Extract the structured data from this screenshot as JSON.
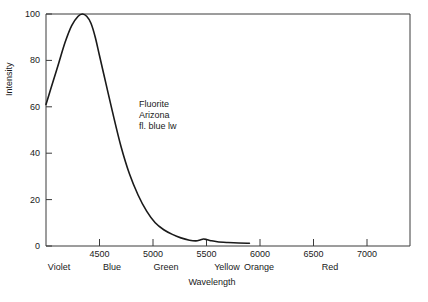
{
  "figure": {
    "background": "#ffffff",
    "line_color": "#1a1a1a",
    "axis_color": "#3a3a3a"
  },
  "annotation": {
    "line1": "Fluorite",
    "line2": "Arizona",
    "line3": "fl. blue lw"
  },
  "axis": {
    "xlabel": "Wavelength",
    "ylabel": "Intensity"
  },
  "bands": [
    {
      "label": "Violet",
      "wavelength": 4150
    },
    {
      "label": "Blue",
      "wavelength": 4650
    },
    {
      "label": "Green",
      "wavelength": 5150
    },
    {
      "label": "Yellow",
      "wavelength": 5720
    },
    {
      "label": "Orange",
      "wavelength": 6020
    },
    {
      "label": "Red",
      "wavelength": 6600
    }
  ],
  "chart_data": {
    "type": "line",
    "title": "",
    "subtitle": "",
    "xlabel": "Wavelength",
    "ylabel": "Intensity",
    "xlim": [
      4000,
      7400
    ],
    "ylim": [
      0,
      100
    ],
    "xticks": [
      4500,
      5000,
      5500,
      6000,
      6500,
      7000
    ],
    "xtick_labels": [
      "4500",
      "5000",
      "5500",
      "6000",
      "6500",
      "7000"
    ],
    "yticks": [
      0,
      20,
      40,
      60,
      80,
      100
    ],
    "ytick_labels": [
      "0",
      "20",
      "40",
      "60",
      "80",
      "100"
    ],
    "grid": false,
    "legend": null,
    "annotations": [
      "Fluorite",
      "Arizona",
      "fl. blue lw"
    ],
    "series": [
      {
        "name": "Fluorite Arizona fl. blue lw emission",
        "x": [
          4000,
          4060,
          4120,
          4180,
          4240,
          4300,
          4340,
          4380,
          4420,
          4460,
          4500,
          4560,
          4620,
          4700,
          4780,
          4860,
          4940,
          5020,
          5100,
          5180,
          5260,
          5340,
          5400,
          5440,
          5470,
          5500,
          5540,
          5600,
          5700,
          5800,
          5900
        ],
        "y": [
          61,
          70,
          79,
          88,
          95,
          99,
          100,
          99,
          96,
          90,
          82,
          70,
          58,
          43,
          31,
          22,
          15,
          10,
          7,
          5,
          3.5,
          2.5,
          2.2,
          2.6,
          3.0,
          2.8,
          2.3,
          1.8,
          1.5,
          1.3,
          1.2
        ]
      }
    ]
  }
}
